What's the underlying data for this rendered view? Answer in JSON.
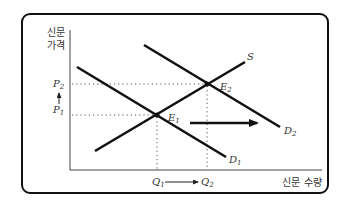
{
  "diagram": {
    "title": "",
    "y_axis_label_line1": "신문",
    "y_axis_label_line2": "가격",
    "x_axis_label": "신문 수량",
    "curves": {
      "supply": {
        "label": "S"
      },
      "demand_1": {
        "label": "D",
        "sub": "1"
      },
      "demand_2": {
        "label": "D",
        "sub": "2"
      }
    },
    "equilibria": {
      "e1": {
        "label": "E",
        "sub": "1"
      },
      "e2": {
        "label": "E",
        "sub": "2"
      }
    },
    "prices": {
      "p1": {
        "label": "P",
        "sub": "1"
      },
      "p2": {
        "label": "P",
        "sub": "2"
      }
    },
    "quantities": {
      "q1": {
        "label": "Q",
        "sub": "1"
      },
      "q2": {
        "label": "Q",
        "sub": "2"
      }
    }
  }
}
